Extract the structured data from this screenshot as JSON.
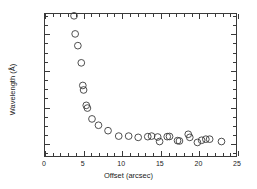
{
  "chart_data": {
    "type": "scatter",
    "title": "",
    "xlabel": "Offset (arcsec)",
    "ylabel": "Wavelength (Å)",
    "xlim": [
      0,
      25
    ],
    "ylim": [
      5797.25,
      5805.1
    ],
    "xticks": [
      0,
      5,
      10,
      15,
      20,
      25
    ],
    "xticklabels": [
      "0",
      "5",
      "10",
      "15",
      "20",
      "25"
    ],
    "yticks": [
      5798,
      5800,
      5802,
      5804
    ],
    "yticklabels": [
      "5798",
      "5800",
      "5802",
      "5804"
    ],
    "x_minor_step": 1,
    "y_minor_step": 0.5,
    "grid": false,
    "legend": null,
    "marker": "open-circle",
    "marker_color": "#3a3a3a",
    "marker_size": 3.4,
    "series": [
      {
        "name": "wavelength vs offset",
        "x": [
          3.8,
          3.95,
          4.3,
          4.75,
          4.95,
          5.05,
          5.4,
          5.55,
          6.15,
          7.0,
          8.25,
          9.65,
          10.95,
          12.2,
          13.45,
          13.95,
          14.75,
          15.0,
          16.0,
          16.3,
          17.35,
          17.6,
          18.75,
          18.95,
          19.95,
          20.5,
          21.05,
          21.55,
          23.1
        ],
        "y": [
          5805.0,
          5804.0,
          5803.35,
          5802.4,
          5801.15,
          5800.9,
          5800.05,
          5799.9,
          5799.3,
          5798.95,
          5798.65,
          5798.35,
          5798.35,
          5798.28,
          5798.32,
          5798.35,
          5798.3,
          5798.05,
          5798.32,
          5798.33,
          5798.1,
          5798.08,
          5798.45,
          5798.28,
          5798.0,
          5798.12,
          5798.18,
          5798.18,
          5798.05
        ]
      }
    ]
  }
}
